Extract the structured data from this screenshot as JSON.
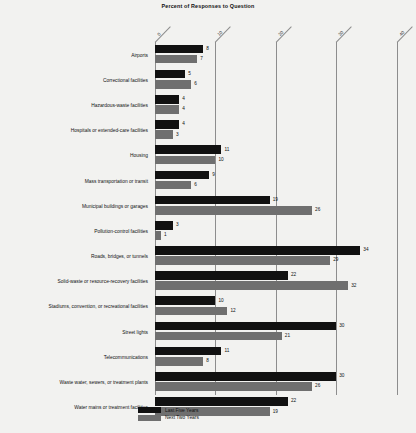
{
  "chart_data": {
    "type": "bar",
    "orientation": "horizontal",
    "title": "Percent of Responses to Question",
    "xlabel": "",
    "ylabel": "",
    "xlim": [
      0,
      40
    ],
    "xticks": [
      "0",
      "10",
      "20",
      "30",
      "40"
    ],
    "grid": true,
    "legend_position": "bottom-left",
    "categories": [
      "Airports",
      "Correctional facilities",
      "Hazardous-waste facilities",
      "Hospitals or extended-care facilities",
      "Housing",
      "Mass transportation or transit",
      "Municipal buildings or garages",
      "Pollution-control facilities",
      "Roads, bridges, or tunnels",
      "Solid-waste or resource-recovery facilities",
      "Stadiums, convention, or recreational facilities",
      "Street lights",
      "Telecommunications",
      "Waste water, sewers, or treatment plants",
      "Water mains or treatment facilities"
    ],
    "series": [
      {
        "name": "Last Five Years",
        "color": "#111111",
        "values": [
          8,
          5,
          4,
          4,
          11,
          9,
          19,
          3,
          34,
          22,
          10,
          30,
          11,
          30,
          22
        ]
      },
      {
        "name": "Next Two Years",
        "color": "#6f6f6f",
        "values": [
          7,
          6,
          4,
          3,
          10,
          6,
          26,
          1,
          29,
          32,
          12,
          21,
          8,
          26,
          19
        ]
      }
    ]
  }
}
